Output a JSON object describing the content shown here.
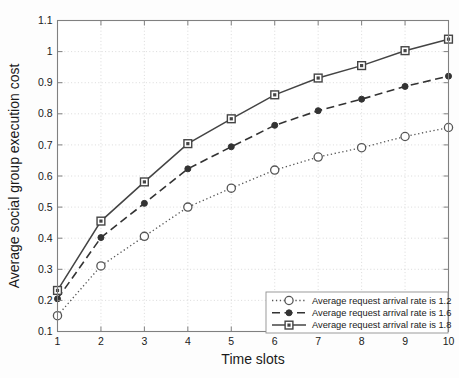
{
  "chart_data": {
    "type": "line",
    "title": "",
    "xlabel": "Time slots",
    "ylabel": "Average social group execution cost",
    "x": [
      1,
      2,
      3,
      4,
      5,
      6,
      7,
      8,
      9,
      10
    ],
    "xlim": [
      1,
      10
    ],
    "ylim": [
      0.1,
      1.1
    ],
    "xticks": [
      "1",
      "2",
      "3",
      "4",
      "5",
      "6",
      "7",
      "8",
      "9",
      "10"
    ],
    "yticks": [
      "0.1",
      "0.2",
      "0.3",
      "0.4",
      "0.5",
      "0.6",
      "0.7",
      "0.8",
      "0.9",
      "1",
      "1.1"
    ],
    "grid": true,
    "legend_position": "lower right",
    "series": [
      {
        "name": "Average request arrival rate is 1.2",
        "rate": "1.2",
        "style": "dotted",
        "marker": "circle",
        "color": "#555555",
        "values": [
          0.151,
          0.311,
          0.406,
          0.5,
          0.561,
          0.619,
          0.661,
          0.691,
          0.727,
          0.756
        ]
      },
      {
        "name": "Average request arrival rate is 1.6",
        "rate": "1.6",
        "style": "dashed",
        "marker": "dot",
        "color": "#333333",
        "values": [
          0.205,
          0.402,
          0.512,
          0.623,
          0.694,
          0.763,
          0.81,
          0.847,
          0.888,
          0.921
        ]
      },
      {
        "name": "Average request arrival rate is 1.8",
        "rate": "1.8",
        "style": "solid",
        "marker": "square",
        "color": "#444444",
        "values": [
          0.232,
          0.455,
          0.581,
          0.704,
          0.784,
          0.861,
          0.915,
          0.955,
          1.003,
          1.04
        ]
      }
    ],
    "grid_color": "#cccccc",
    "axis_color": "#808080",
    "background": "#ffffff"
  }
}
